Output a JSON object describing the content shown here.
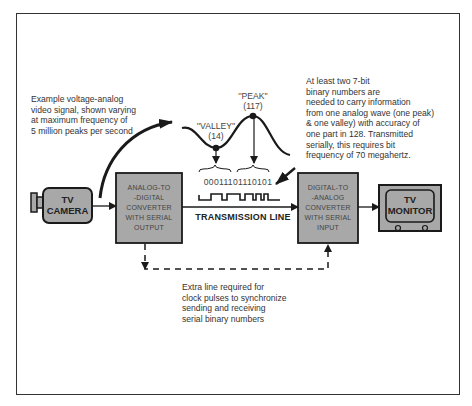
{
  "diagram": {
    "notes": {
      "left": "Example voltage-analog\nvideo signal, shown varying\nat maximum frequency of\n5 million peaks per second",
      "right": "At least two 7-bit\nbinary numbers are\nneeded to carry information\nfrom one analog wave (one peak)\n& one valley) with accuracy of\none part in 128. Transmitted\nserially, this requires bit\nfrequency of 70 megahertz.",
      "bottom": "Extra line required for\nclock pulses to synchronize\nsending and receiving\nserial binary numbers"
    },
    "nodes": {
      "camera": "TV\nCAMERA",
      "adc": "ANALOG-TO\n-DIGITAL\nCONVERTER\nWITH SERIAL\nOUTPUT",
      "dac": "DIGITAL-TO\n-ANALOG\nCONVERTER\nWITH SERIAL\nINPUT",
      "monitor": "TV\nMONITOR"
    },
    "signal": {
      "valley_label": "''VALLEY''",
      "valley_value": "(14)",
      "peak_label": "''PEAK''",
      "peak_value": "(117)",
      "binary": "00011101110101"
    },
    "transmission_line_label": "TRANSMISSION LINE",
    "colors": {
      "box_fill": "#a8a8a8",
      "stroke": "#1a1a1a",
      "text": "#333333"
    }
  }
}
